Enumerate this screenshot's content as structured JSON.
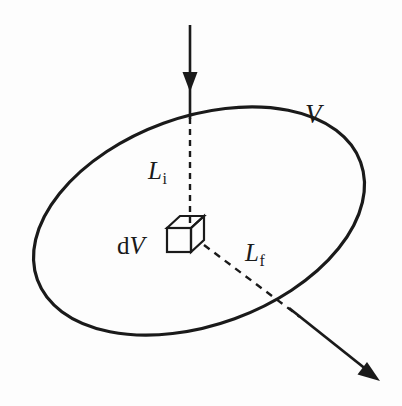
{
  "figure": {
    "background_color": "#fdfdfd",
    "ink_color": "#1a1a1a",
    "width": 402,
    "height": 406,
    "labels": {
      "volume": {
        "symbol": "V",
        "style": "italic",
        "meaning": "total volume region"
      },
      "incoming_path": {
        "symbol": "L",
        "subscript": "i",
        "meaning": "initial path length"
      },
      "outgoing_path": {
        "symbol": "L",
        "subscript": "f",
        "meaning": "final path length"
      },
      "volume_element": {
        "prefix": "d",
        "symbol": "V",
        "meaning": "differential volume element"
      }
    },
    "shapes": {
      "boundary": {
        "type": "ellipse",
        "cx": 199,
        "cy": 221,
        "rx": 172,
        "ry": 104,
        "rotation_deg": -20,
        "stroke_width": 3.2,
        "fill": "none"
      },
      "incoming_ray": {
        "type": "arrow-solid",
        "x1": 190,
        "y1": 25,
        "x2": 190,
        "y2": 118,
        "arrowhead_at": {
          "x": 190,
          "y": 88
        },
        "stroke_width": 2.6
      },
      "incoming_ray_dashed": {
        "type": "line-dashed",
        "x1": 190,
        "y1": 118,
        "x2": 190,
        "y2": 224,
        "dash": "6 5",
        "stroke_width": 2.4
      },
      "outgoing_ray_dashed": {
        "type": "line-dashed",
        "x1": 203,
        "y1": 244,
        "x2": 299,
        "y2": 316,
        "dash": "7 6",
        "stroke_width": 2.4
      },
      "outgoing_ray": {
        "type": "arrow-solid",
        "x1": 290,
        "y1": 309,
        "x2": 379,
        "y2": 380,
        "stroke_width": 2.8
      },
      "volume_element_cube": {
        "type": "cube-oblique",
        "front_x": 167,
        "front_y": 228,
        "size": 24,
        "depth_x": 13,
        "depth_y": -12,
        "stroke_width": 2.2
      }
    }
  }
}
